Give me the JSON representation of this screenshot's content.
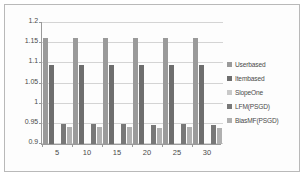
{
  "chart_data": {
    "type": "bar",
    "title": "",
    "xlabel": "",
    "ylabel": "",
    "ylim": [
      0.9,
      1.2
    ],
    "yticks": [
      "0.9",
      "0.95",
      "1",
      "1.05",
      "1.1",
      "1.15",
      "1.2"
    ],
    "ytick_values": [
      0.9,
      0.95,
      1.0,
      1.05,
      1.1,
      1.15,
      1.2
    ],
    "grid": true,
    "legend_position": "right",
    "categories": [
      "5",
      "10",
      "15",
      "20",
      "25",
      "30"
    ],
    "series": [
      {
        "name": "Userbased",
        "color": "#9a9a9a",
        "values": [
          1.16,
          1.16,
          1.16,
          1.16,
          1.16,
          1.16
        ]
      },
      {
        "name": "Itembased",
        "color": "#6e6e6e",
        "values": [
          1.095,
          1.095,
          1.095,
          1.095,
          1.094,
          1.095
        ]
      },
      {
        "name": "SlopeOne",
        "color": "#c9c9c9",
        "values": [
          0.9,
          0.9,
          0.9,
          0.9,
          0.9,
          0.9
        ]
      },
      {
        "name": "LFM(PSGD)",
        "color": "#787878",
        "values": [
          0.948,
          0.948,
          0.948,
          0.947,
          0.948,
          0.947
        ]
      },
      {
        "name": "BiasMF(PSGD)",
        "color": "#b0b0b0",
        "values": [
          0.943,
          0.943,
          0.943,
          0.939,
          0.942,
          0.94
        ]
      }
    ]
  }
}
